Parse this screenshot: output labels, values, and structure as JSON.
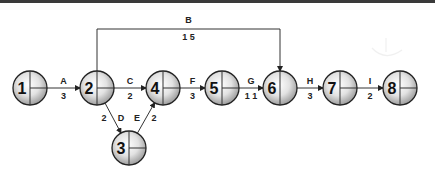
{
  "diagram": {
    "type": "activity-on-arrow network",
    "nodes": [
      {
        "id": "1",
        "label": "1",
        "cx": 30,
        "cy": 88,
        "quad": true
      },
      {
        "id": "2",
        "label": "2",
        "cx": 97,
        "cy": 88,
        "quad": true
      },
      {
        "id": "3",
        "label": "3",
        "cx": 129,
        "cy": 148,
        "quad": true
      },
      {
        "id": "4",
        "label": "4",
        "cx": 163,
        "cy": 88,
        "quad": true
      },
      {
        "id": "5",
        "label": "5",
        "cx": 222,
        "cy": 88,
        "quad": true
      },
      {
        "id": "6",
        "label": "6",
        "cx": 280,
        "cy": 88,
        "quad": false
      },
      {
        "id": "7",
        "label": "7",
        "cx": 340,
        "cy": 88,
        "quad": true
      },
      {
        "id": "8",
        "label": "8",
        "cx": 400,
        "cy": 88,
        "quad": true
      }
    ],
    "activities": [
      {
        "name": "A",
        "duration": "3",
        "from": "1",
        "to": "2"
      },
      {
        "name": "B",
        "duration": "1 5",
        "from": "2",
        "to": "6"
      },
      {
        "name": "C",
        "duration": "2",
        "from": "2",
        "to": "4"
      },
      {
        "name": "D",
        "duration": "2",
        "from": "2",
        "to": "3"
      },
      {
        "name": "E",
        "duration": "2",
        "from": "3",
        "to": "4"
      },
      {
        "name": "F",
        "duration": "3",
        "from": "4",
        "to": "5"
      },
      {
        "name": "G",
        "duration": "1 1",
        "from": "5",
        "to": "6"
      },
      {
        "name": "H",
        "duration": "3",
        "from": "6",
        "to": "7"
      },
      {
        "name": "I",
        "duration": "2",
        "from": "7",
        "to": "8"
      }
    ]
  },
  "colors": {
    "line": "#333333",
    "node_stroke": "#222222",
    "node_fill_light": "#f4f4f4",
    "node_fill_dark": "#a8a8a8",
    "top_bar": "#3a3a3a"
  }
}
